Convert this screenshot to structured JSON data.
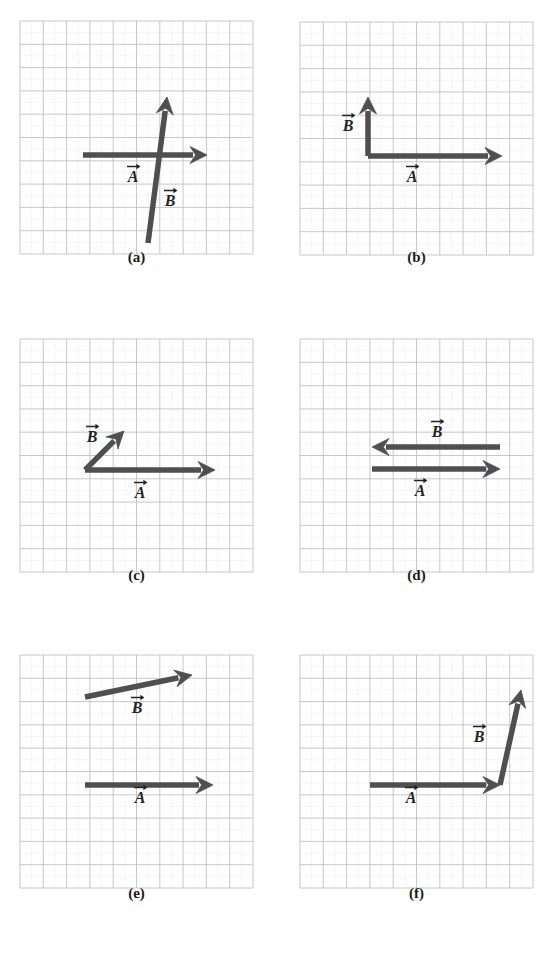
{
  "figure": {
    "background_color": "#ffffff",
    "vector_color": "#4f4f4f",
    "grid_major_color": "#b9b9c4",
    "grid_minor_color": "#d9d9e2",
    "label_color": "#232323",
    "caption_color": "#1a1a1a",
    "bottom_artifact_text": ""
  },
  "panels": [
    {
      "id": "panel-a",
      "caption": "(a)",
      "origin": {
        "x": 20,
        "y": 21
      },
      "grid": {
        "cols": 10,
        "rows": 10,
        "cell": 23.3
      },
      "caption_top": 262,
      "vectors": [
        {
          "name": "A",
          "label": "A",
          "label_x": 133,
          "label_y": 182,
          "x1": 83,
          "y1": 155,
          "x2": 207,
          "y2": 155,
          "direction": "right",
          "thickness": 5.5
        },
        {
          "name": "B",
          "label": "B",
          "label_x": 170,
          "label_y": 206,
          "x1": 148,
          "y1": 243,
          "x2": 167,
          "y2": 97,
          "direction": "up-right-steep",
          "thickness": 5.5
        }
      ]
    },
    {
      "id": "panel-b",
      "caption": "(b)",
      "origin": {
        "x": 300,
        "y": 22
      },
      "grid": {
        "cols": 10,
        "rows": 10,
        "cell": 23.3
      },
      "caption_top": 262,
      "vectors": [
        {
          "name": "A",
          "label": "A",
          "label_x": 412,
          "label_y": 182,
          "x1": 368,
          "y1": 156,
          "x2": 502,
          "y2": 156,
          "direction": "right",
          "thickness": 5.5
        },
        {
          "name": "B",
          "label": "B",
          "label_x": 348,
          "label_y": 131,
          "x1": 368,
          "y1": 156,
          "x2": 368,
          "y2": 97,
          "direction": "up",
          "thickness": 5.5
        }
      ]
    },
    {
      "id": "panel-c",
      "caption": "(c)",
      "origin": {
        "x": 20,
        "y": 339
      },
      "grid": {
        "cols": 10,
        "rows": 10,
        "cell": 23.3
      },
      "caption_top": 580,
      "vectors": [
        {
          "name": "A",
          "label": "A",
          "label_x": 140,
          "label_y": 498,
          "x1": 85,
          "y1": 470,
          "x2": 215,
          "y2": 470,
          "direction": "right",
          "thickness": 5.5
        },
        {
          "name": "B",
          "label": "B",
          "label_x": 92,
          "label_y": 442,
          "x1": 85,
          "y1": 470,
          "x2": 124,
          "y2": 431,
          "direction": "up-right-45",
          "thickness": 5.5
        }
      ]
    },
    {
      "id": "panel-d",
      "caption": "(d)",
      "origin": {
        "x": 300,
        "y": 339
      },
      "grid": {
        "cols": 10,
        "rows": 10,
        "cell": 23.3
      },
      "caption_top": 580,
      "vectors": [
        {
          "name": "B",
          "label": "B",
          "label_x": 437,
          "label_y": 437,
          "x1": 500,
          "y1": 447,
          "x2": 372,
          "y2": 447,
          "direction": "left",
          "thickness": 5.5
        },
        {
          "name": "A",
          "label": "A",
          "label_x": 420,
          "label_y": 496,
          "x1": 372,
          "y1": 469,
          "x2": 500,
          "y2": 469,
          "direction": "right",
          "thickness": 5.5
        }
      ]
    },
    {
      "id": "panel-e",
      "caption": "(e)",
      "origin": {
        "x": 20,
        "y": 655
      },
      "grid": {
        "cols": 10,
        "rows": 10,
        "cell": 23.3
      },
      "caption_top": 898,
      "vectors": [
        {
          "name": "B",
          "label": "B",
          "label_x": 137,
          "label_y": 713,
          "x1": 85,
          "y1": 697,
          "x2": 192,
          "y2": 675,
          "direction": "up-right-shallow",
          "thickness": 5.5
        },
        {
          "name": "A",
          "label": "A",
          "label_x": 140,
          "label_y": 803,
          "x1": 85,
          "y1": 785,
          "x2": 213,
          "y2": 785,
          "direction": "right",
          "thickness": 5.5
        }
      ]
    },
    {
      "id": "panel-f",
      "caption": "(f)",
      "origin": {
        "x": 300,
        "y": 655
      },
      "grid": {
        "cols": 10,
        "rows": 10,
        "cell": 23.3
      },
      "caption_top": 898,
      "vectors": [
        {
          "name": "A",
          "label": "A",
          "label_x": 411,
          "label_y": 803,
          "x1": 370,
          "y1": 785,
          "x2": 500,
          "y2": 785,
          "direction": "right",
          "thickness": 5.5
        },
        {
          "name": "B",
          "label": "B",
          "label_x": 479,
          "label_y": 742,
          "x1": 500,
          "y1": 785,
          "x2": 521,
          "y2": 690,
          "direction": "up-right-steep",
          "thickness": 5.5
        }
      ]
    }
  ],
  "labels": {
    "vector_a": "A",
    "vector_b": "B",
    "arrow_accent": "→"
  },
  "captions": [
    "(a)",
    "(b)",
    "(c)",
    "(d)",
    "(e)",
    "(f)"
  ]
}
